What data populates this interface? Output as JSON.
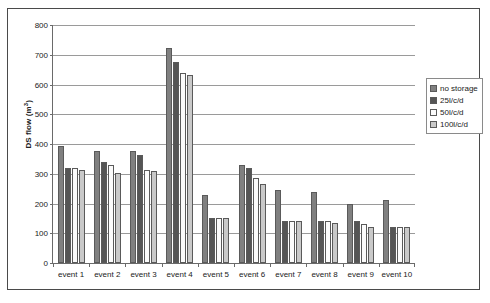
{
  "chart_data": {
    "type": "bar",
    "title": "",
    "xlabel": "",
    "ylabel": "DS flow (m³)",
    "ylabel_base": "DS flow (m",
    "ylabel_sup": "3",
    "ylabel_tail": ")",
    "ylim": [
      0,
      800
    ],
    "ytick_step": 100,
    "yticks": [
      800,
      700,
      600,
      500,
      400,
      300,
      200,
      100,
      0
    ],
    "ytick_labels": [
      "800",
      "700",
      "600",
      "500",
      "400",
      "300",
      "200",
      "100",
      "0"
    ],
    "grid": true,
    "legend_position": "right",
    "categories": [
      "event 1",
      "event 2",
      "event 3",
      "event 4",
      "event 5",
      "event 6",
      "event 7",
      "event 8",
      "event 9",
      "event 10"
    ],
    "series": [
      {
        "name": "no storage",
        "color": "#808080",
        "values": [
          395,
          378,
          378,
          722,
          230,
          330,
          245,
          238,
          200,
          212
        ]
      },
      {
        "name": "25l/c/d",
        "color": "#555555",
        "values": [
          318,
          338,
          362,
          675,
          152,
          318,
          140,
          142,
          142,
          122
        ]
      },
      {
        "name": "50l/c/d",
        "color": "#fbfbfb",
        "values": [
          318,
          330,
          312,
          640,
          150,
          285,
          140,
          142,
          130,
          122
        ]
      },
      {
        "name": "100l/c/d",
        "color": "#c9c9c9",
        "values": [
          312,
          303,
          310,
          632,
          150,
          265,
          140,
          135,
          122,
          122
        ]
      }
    ]
  }
}
